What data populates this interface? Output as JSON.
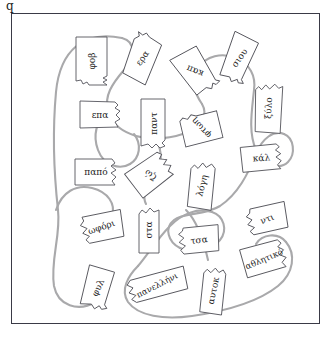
{
  "page": {
    "corner_mark": "q",
    "frame": {
      "border_color": "#3a3a46",
      "background": "#ffffff"
    },
    "thread": {
      "color": "#a9a9ab",
      "width": 2.1,
      "label": "connecting-thread"
    }
  },
  "cards": [
    {
      "id": "card-fov",
      "text": "φοβ",
      "x": 63,
      "y": 22,
      "w": 33,
      "h": 50,
      "rot": 0,
      "text_rot": -90,
      "size": 9,
      "shape": "tab-bottom"
    },
    {
      "id": "card-era",
      "text": "ερα",
      "x": 115,
      "y": 18,
      "w": 31,
      "h": 52,
      "rot": 17,
      "text_rot": -72,
      "size": 9,
      "shape": "tab-top"
    },
    {
      "id": "card-kap",
      "text": "καπ",
      "x": 167,
      "y": 32,
      "w": 32,
      "h": 50,
      "rot": -34,
      "text_rot": -124,
      "size": 9,
      "shape": "tab-bottom"
    },
    {
      "id": "card-siou",
      "text": "σιου",
      "x": 213,
      "y": 18,
      "w": 29,
      "h": 52,
      "rot": 18,
      "text_rot": -72,
      "size": 9,
      "shape": "tab-bottom"
    },
    {
      "id": "card-xylo",
      "text": "ξύλο",
      "x": 242,
      "y": 68,
      "w": 29,
      "h": 52,
      "rot": 2,
      "text_rot": -90,
      "size": 9,
      "shape": "tab-top"
    },
    {
      "id": "card-epa",
      "text": "επα",
      "x": 67,
      "y": 86,
      "w": 42,
      "h": 29,
      "rot": 0,
      "text_rot": 0,
      "size": 9,
      "shape": "tab-right"
    },
    {
      "id": "card-pant",
      "text": "παντ",
      "x": 128,
      "y": 84,
      "w": 26,
      "h": 51,
      "rot": 0,
      "text_rot": -90,
      "size": 9,
      "shape": "tab-bottom"
    },
    {
      "id": "card-ftosi",
      "text": "φτωη",
      "x": 167,
      "y": 97,
      "w": 44,
      "h": 35,
      "rot": -22,
      "text_rot": -112,
      "size": 9,
      "shape": "tab-left"
    },
    {
      "id": "card-kal",
      "text": "κάλ",
      "x": 228,
      "y": 130,
      "w": 43,
      "h": 28,
      "rot": -4,
      "text_rot": 0,
      "size": 9,
      "shape": "tab-right"
    },
    {
      "id": "card-papo",
      "text": "παπό",
      "x": 62,
      "y": 144,
      "w": 44,
      "h": 28,
      "rot": 0,
      "text_rot": 0,
      "size": 9,
      "shape": "tab-right"
    },
    {
      "id": "card-zo",
      "text": "ζώ",
      "x": 115,
      "y": 143,
      "w": 47,
      "h": 36,
      "rot": -28,
      "text_rot": -118,
      "size": 9,
      "shape": "tab-right"
    },
    {
      "id": "card-logi",
      "text": "λόγη",
      "x": 176,
      "y": 147,
      "w": 27,
      "h": 49,
      "rot": 7,
      "text_rot": -82,
      "size": 9,
      "shape": "tab-top"
    },
    {
      "id": "card-oforii",
      "text": "ωφόρι",
      "x": 67,
      "y": 198,
      "w": 45,
      "h": 30,
      "rot": -10,
      "text_rot": -9,
      "size": 9,
      "shape": "tab-left"
    },
    {
      "id": "card-sta",
      "text": "στα",
      "x": 126,
      "y": 192,
      "w": 22,
      "h": 48,
      "rot": 0,
      "text_rot": -90,
      "size": 9,
      "shape": "tab-top"
    },
    {
      "id": "card-nti",
      "text": "ντι",
      "x": 234,
      "y": 190,
      "w": 42,
      "h": 29,
      "rot": -11,
      "text_rot": -11,
      "size": 9,
      "shape": "tab-left"
    },
    {
      "id": "card-tsa",
      "text": "τσα",
      "x": 166,
      "y": 211,
      "w": 42,
      "h": 29,
      "rot": -4,
      "text_rot": -3,
      "size": 9,
      "shape": "tab-left"
    },
    {
      "id": "card-athlitiko",
      "text": "αθλητικό",
      "x": 229,
      "y": 228,
      "w": 46,
      "h": 34,
      "rot": -12,
      "text_rot": -11,
      "size": 8.5,
      "shape": "tab-right"
    },
    {
      "id": "card-fil",
      "text": "φυλ",
      "x": 71,
      "y": 251,
      "w": 29,
      "h": 45,
      "rot": 12,
      "text_rot": -77,
      "size": 9,
      "shape": "tab-bottom"
    },
    {
      "id": "card-panellini",
      "text": "πανελλήνι",
      "x": 114,
      "y": 258,
      "w": 62,
      "h": 26,
      "rot": -14,
      "text_rot": -13,
      "size": 8.5,
      "shape": "tab-left"
    },
    {
      "id": "card-aftok",
      "text": "αυτοκ",
      "x": 189,
      "y": 252,
      "w": 24,
      "h": 49,
      "rot": 6,
      "text_rot": -84,
      "size": 9,
      "shape": "tab-top"
    }
  ]
}
